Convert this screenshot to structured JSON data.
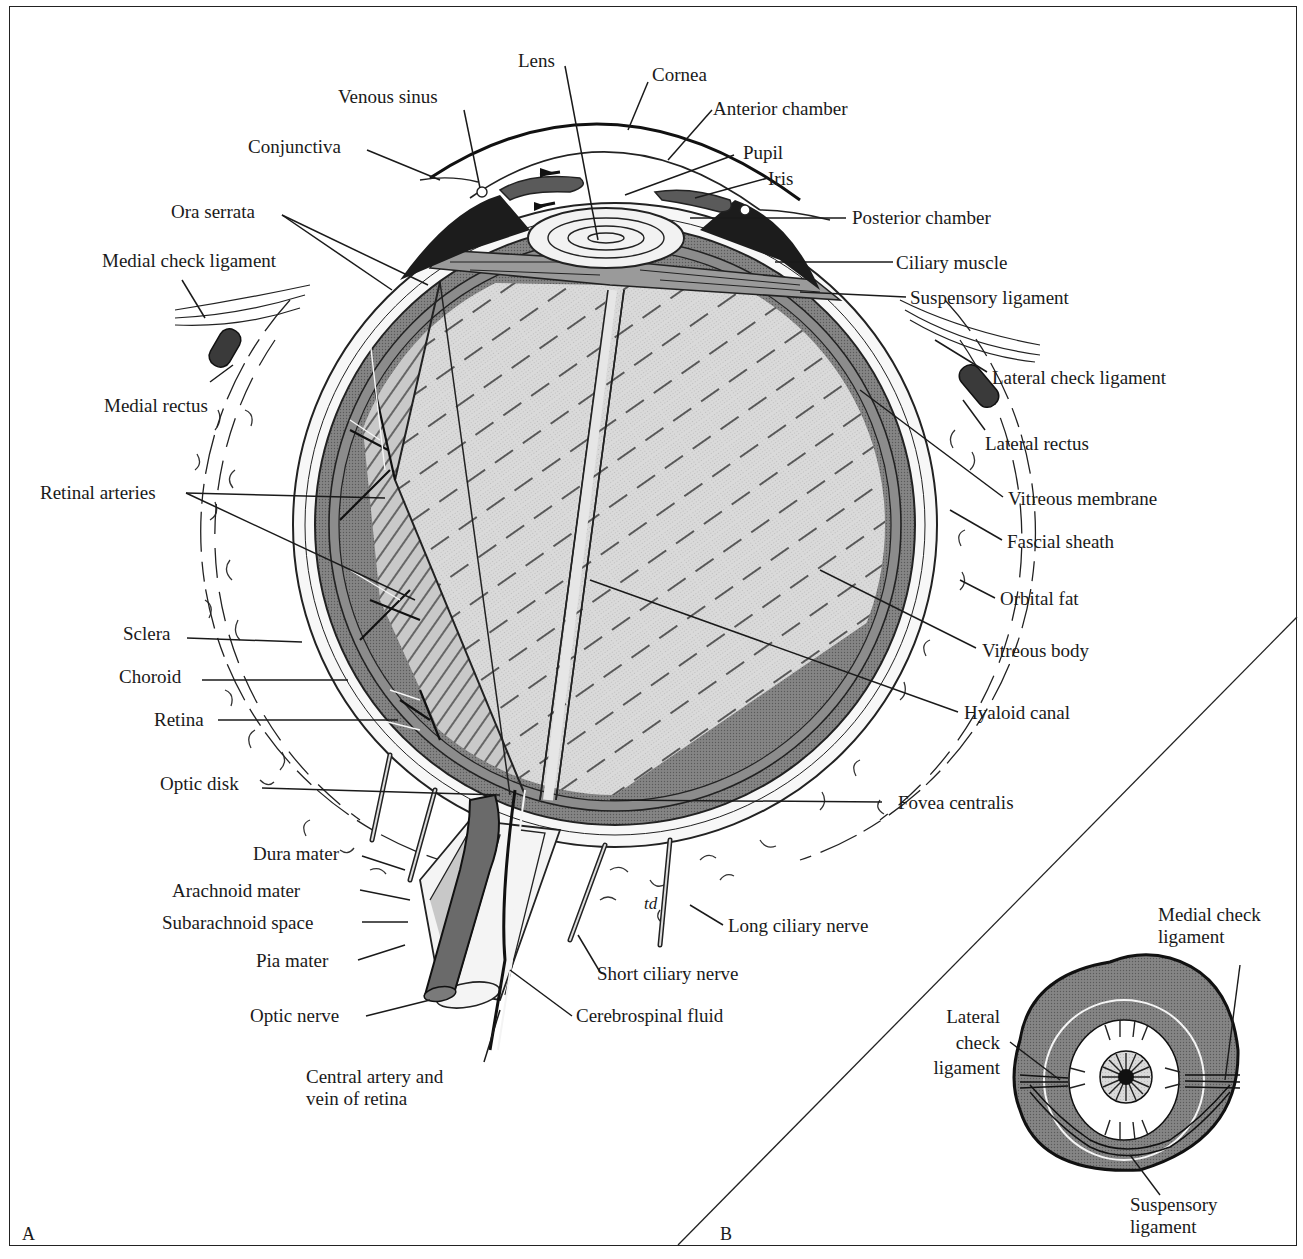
{
  "figure": {
    "panel_a_letter": "A",
    "panel_b_letter": "B",
    "colors": {
      "background": "#ffffff",
      "line": "#1a1a1a",
      "vitreous_fill": "#d6d6d6",
      "retina_fill": "#8a8a8a",
      "choroid_fill": "#5e5e5e",
      "sclera_fill": "#f2f2f2",
      "orbit_fill": "#7d7d7d"
    }
  },
  "panel_a": {
    "labels": {
      "lens": "Lens",
      "cornea": "Cornea",
      "venous_sinus": "Venous sinus",
      "anterior_chamber": "Anterior chamber",
      "conjunctiva": "Conjunctiva",
      "pupil": "Pupil",
      "iris": "Iris",
      "ora_serrata": "Ora serrata",
      "posterior_chamber": "Posterior chamber",
      "medial_check_ligament": "Medial check ligament",
      "ciliary_muscle": "Ciliary muscle",
      "suspensory_ligament": "Suspensory ligament",
      "lateral_check_ligament": "Lateral check ligament",
      "medial_rectus": "Medial rectus",
      "lateral_rectus": "Lateral rectus",
      "retinal_arteries": "Retinal arteries",
      "vitreous_membrane": "Vitreous membrane",
      "fascial_sheath": "Fascial sheath",
      "orbital_fat": "Orbital fat",
      "sclera": "Sclera",
      "vitreous_body": "Vitreous body",
      "choroid": "Choroid",
      "hyaloid_canal": "Hyaloid canal",
      "retina": "Retina",
      "optic_disk": "Optic disk",
      "fovea_centralis": "Fovea centralis",
      "dura_mater": "Dura mater",
      "arachnoid_mater": "Arachnoid mater",
      "subarachnoid_space": "Subarachnoid space",
      "long_ciliary_nerve": "Long ciliary nerve",
      "pia_mater": "Pia mater",
      "short_ciliary_nerve": "Short ciliary nerve",
      "optic_nerve": "Optic nerve",
      "cerebrospinal_fluid": "Cerebrospinal fluid",
      "central_artery_line1": "Central artery and",
      "central_artery_line2": "vein of retina",
      "artist_mark": "td"
    }
  },
  "panel_b": {
    "labels": {
      "medial_check_line1": "Medial check",
      "medial_check_line2": "ligament",
      "lateral_line1": "Lateral",
      "lateral_line2": "check",
      "lateral_line3": "ligament",
      "suspensory_line1": "Suspensory",
      "suspensory_line2": "ligament"
    }
  }
}
